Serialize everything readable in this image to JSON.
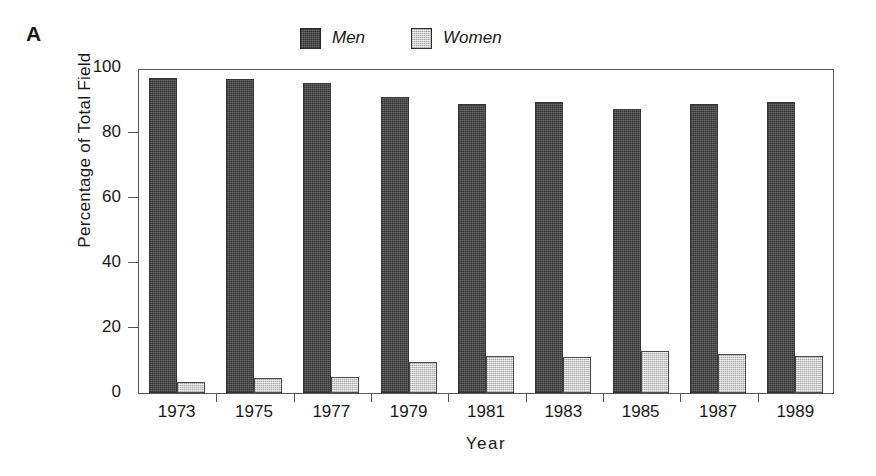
{
  "panel": {
    "label": "A"
  },
  "legend": {
    "position": "top-center",
    "entries": [
      {
        "label": "Men",
        "swatch": "dark-gray-swatch",
        "color": "#4d4d4d"
      },
      {
        "label": "Women",
        "swatch": "light-gray-swatch",
        "color": "#d2d2d2"
      }
    ]
  },
  "chart_data": {
    "type": "bar",
    "title": "",
    "subtitle": "",
    "xlabel": "Year",
    "ylabel": "Percentage of Total Field",
    "categories": [
      "1973",
      "1975",
      "1977",
      "1979",
      "1981",
      "1983",
      "1985",
      "1987",
      "1989"
    ],
    "series": [
      {
        "name": "Men",
        "color": "#4d4d4d",
        "values": [
          97,
          96.5,
          95.5,
          91,
          89,
          89.5,
          87.5,
          89,
          89.5
        ]
      },
      {
        "name": "Women",
        "color": "#d2d2d2",
        "values": [
          3.5,
          4.5,
          5,
          9.5,
          11.5,
          11,
          13,
          12,
          11.5
        ]
      }
    ],
    "ylim": [
      0,
      100
    ],
    "yticks": [
      0,
      20,
      40,
      60,
      80,
      100
    ],
    "ytick_labels": [
      "0",
      "20",
      "40",
      "60",
      "80",
      "100"
    ],
    "grid": false,
    "legend_position": "top-center",
    "annotations": []
  }
}
